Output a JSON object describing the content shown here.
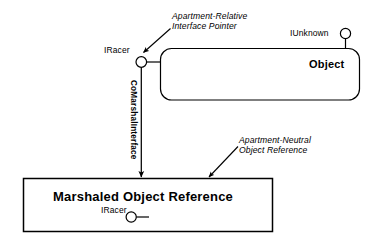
{
  "diagram": {
    "type": "com-marshaling-diagram",
    "background_color": "#ffffff",
    "stroke_color": "#000000",
    "object_box": {
      "title": "Object",
      "interfaces": [
        {
          "name": "IUnknown",
          "position": "top-right"
        },
        {
          "name": "IRacer",
          "position": "left"
        }
      ]
    },
    "marshaled_box": {
      "title": "Marshaled Object Reference",
      "interfaces": [
        {
          "name": "IRacer",
          "position": "inside-center"
        }
      ]
    },
    "connector": {
      "label_line1": "CoMarshalInterface",
      "orientation": "vertical"
    },
    "annotations": [
      {
        "id": "apartment-relative",
        "line1": "Apartment-Relative",
        "line2": "Interface Pointer",
        "target": "iracer-top-lollipop"
      },
      {
        "id": "apartment-neutral",
        "line1": "Apartment-Neutral",
        "line2": "Object Reference",
        "target": "marshaled-object-reference-box"
      }
    ]
  }
}
